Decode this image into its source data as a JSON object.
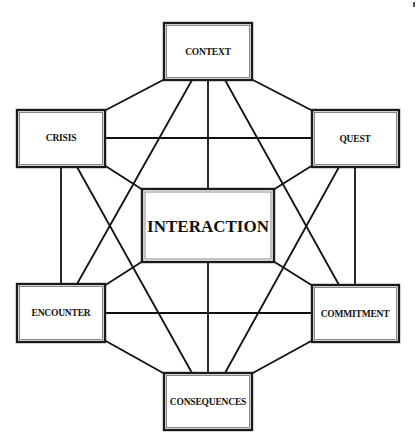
{
  "diagram": {
    "type": "network-hexagon",
    "colors": {
      "line": "#111111",
      "box_fill": "#ffffff",
      "text": "#111111"
    },
    "nodes": [
      {
        "id": "context",
        "label": "CONTEXT",
        "x": 164,
        "y": 23,
        "w": 88,
        "h": 57
      },
      {
        "id": "crisis",
        "label": "CRISIS",
        "x": 17,
        "y": 110,
        "w": 88,
        "h": 57
      },
      {
        "id": "quest",
        "label": "QUEST",
        "x": 312,
        "y": 110,
        "w": 87,
        "h": 57
      },
      {
        "id": "interaction",
        "label": "INTERACTION",
        "x": 142,
        "y": 189,
        "w": 132,
        "h": 73
      },
      {
        "id": "encounter",
        "label": "ENCOUNTER",
        "x": 17,
        "y": 284,
        "w": 88,
        "h": 58
      },
      {
        "id": "commitment",
        "label": "COMMITMENT",
        "x": 312,
        "y": 285,
        "w": 87,
        "h": 57
      },
      {
        "id": "consequences",
        "label": "CONSEQUENCES",
        "x": 164,
        "y": 373,
        "w": 88,
        "h": 57
      }
    ],
    "edges": [
      {
        "from": "context",
        "to": "crisis"
      },
      {
        "from": "context",
        "to": "quest"
      },
      {
        "from": "context",
        "to": "interaction"
      },
      {
        "from": "context",
        "to": "encounter"
      },
      {
        "from": "context",
        "to": "commitment"
      },
      {
        "from": "crisis",
        "to": "quest"
      },
      {
        "from": "crisis",
        "to": "interaction"
      },
      {
        "from": "crisis",
        "to": "encounter"
      },
      {
        "from": "crisis",
        "to": "consequences"
      },
      {
        "from": "quest",
        "to": "interaction"
      },
      {
        "from": "quest",
        "to": "commitment"
      },
      {
        "from": "quest",
        "to": "consequences"
      },
      {
        "from": "interaction",
        "to": "encounter"
      },
      {
        "from": "interaction",
        "to": "commitment"
      },
      {
        "from": "interaction",
        "to": "consequences"
      },
      {
        "from": "encounter",
        "to": "commitment"
      },
      {
        "from": "encounter",
        "to": "consequences"
      },
      {
        "from": "commitment",
        "to": "consequences"
      }
    ]
  }
}
